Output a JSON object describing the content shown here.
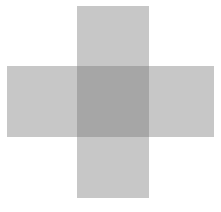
{
  "canvas": {
    "width": 221,
    "height": 212,
    "background_color": "#ffffff"
  },
  "diagram": {
    "shape_fill_color": "#b8b8b8",
    "overlap_fill_color": "#909090",
    "shapes": [
      {
        "name": "vertical-bar",
        "orientation": "vertical",
        "x": 77,
        "y": 6,
        "width": 72,
        "height": 192,
        "fill": "#b8b8b8",
        "opacity": 0.42
      },
      {
        "name": "horizontal-bar",
        "orientation": "horizontal",
        "x": 7,
        "y": 66,
        "width": 207,
        "height": 71,
        "fill": "#b8b8b8",
        "opacity": 0.42
      }
    ],
    "overlap": {
      "name": "intersection",
      "x": 77,
      "y": 66,
      "width": 72,
      "height": 71,
      "fill": "#909090"
    }
  },
  "caption": {
    "text": ""
  }
}
